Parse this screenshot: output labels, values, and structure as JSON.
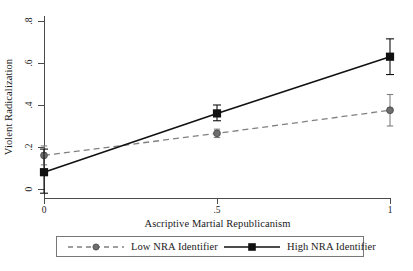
{
  "chart_data": {
    "type": "line",
    "title": "",
    "xlabel": "Ascriptive Martial Republicanism",
    "ylabel": "Violent Radicalization",
    "x": [
      0,
      0.5,
      1
    ],
    "xlim": [
      0,
      1
    ],
    "ylim": [
      -0.05,
      0.85
    ],
    "xticks": [
      "0",
      ".5",
      "1"
    ],
    "yticks": [
      "0",
      ".2",
      ".4",
      ".6",
      ".8"
    ],
    "ytick_values": [
      0,
      0.2,
      0.4,
      0.6,
      0.8
    ],
    "grid": false,
    "legend_position": "below-axes",
    "series": [
      {
        "name": "Low NRA Identifier",
        "values": [
          0.16,
          0.265,
          0.375
        ],
        "ci_low": [
          0.115,
          0.245,
          0.3
        ],
        "ci_high": [
          0.205,
          0.285,
          0.45
        ],
        "color": "#808080",
        "linestyle": "dashed",
        "marker": "circle"
      },
      {
        "name": "High NRA Identifier",
        "values": [
          0.08,
          0.36,
          0.63
        ],
        "ci_low": [
          -0.02,
          0.325,
          0.545
        ],
        "ci_high": [
          0.19,
          0.4,
          0.715
        ],
        "color": "#111111",
        "linestyle": "solid",
        "marker": "square"
      }
    ]
  },
  "axes": {
    "x_title": "Ascriptive Martial Republicanism",
    "y_title": "Violent Radicalization"
  },
  "legend": {
    "entries": [
      {
        "label": "Low NRA Identifier"
      },
      {
        "label": "High NRA Identifier"
      }
    ]
  },
  "caption": {
    "text": ""
  }
}
